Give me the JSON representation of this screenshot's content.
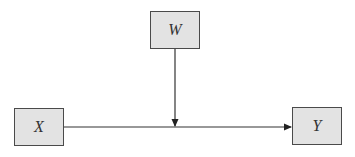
{
  "diagram": {
    "type": "moderation-path-diagram",
    "nodes": [
      {
        "id": "W",
        "label": "W",
        "role": "moderator"
      },
      {
        "id": "X",
        "label": "X",
        "role": "predictor"
      },
      {
        "id": "Y",
        "label": "Y",
        "role": "outcome"
      }
    ],
    "edges": [
      {
        "from": "X",
        "to": "Y",
        "style": "arrow"
      },
      {
        "from": "W",
        "to": "X->Y path",
        "style": "arrow"
      }
    ],
    "colors": {
      "node_fill": "#e3e3e3",
      "node_border": "#4a4a4a",
      "edge": "#333333",
      "background": "#ffffff"
    }
  }
}
